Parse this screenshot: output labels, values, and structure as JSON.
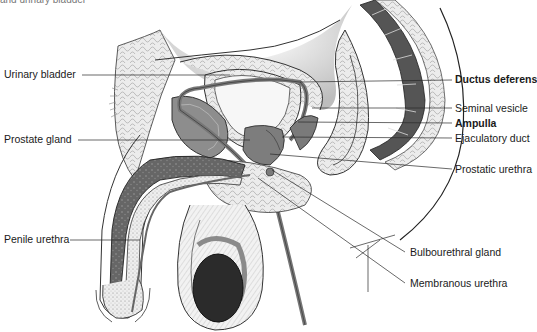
{
  "figure": {
    "caption_fragment": "and urinary bladder",
    "labels_left": [
      {
        "id": "urinary-bladder",
        "text": "Urinary bladder"
      },
      {
        "id": "prostate-gland",
        "text": "Prostate gland"
      },
      {
        "id": "penile-urethra",
        "text": "Penile urethra"
      }
    ],
    "labels_right": [
      {
        "id": "ductus-deferens",
        "text": "Ductus deferens"
      },
      {
        "id": "seminal-vesicle",
        "text": "Seminal vesicle"
      },
      {
        "id": "ampulla",
        "text": "Ampulla"
      },
      {
        "id": "ejaculatory-duct",
        "text": "Ejaculatory duct"
      },
      {
        "id": "prostatic-urethra",
        "text": "Prostatic urethra"
      },
      {
        "id": "bulbourethral-gland",
        "text": "Bulbourethral gland"
      },
      {
        "id": "membranous-urethra",
        "text": "Membranous urethra"
      }
    ],
    "colors": {
      "line": "#2a2a2a",
      "organ_gray": "#8a8a8a",
      "dark_tissue": "#5e5e5e",
      "testis": "#2b2b2b",
      "fat": "#e4e4e4",
      "shading": "#cfcfcf"
    }
  }
}
